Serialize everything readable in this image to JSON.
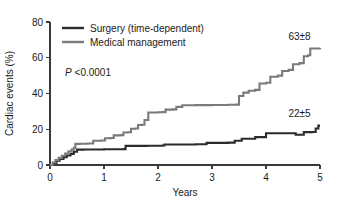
{
  "chart_data": {
    "type": "line",
    "subtype": "kaplan-meier-step",
    "title": "",
    "xlabel": "Years",
    "ylabel": "Cardiac events (%)",
    "xlim": [
      0,
      5
    ],
    "ylim": [
      0,
      80
    ],
    "xticks": [
      0,
      1,
      2,
      3,
      4,
      5
    ],
    "xtick_labels": [
      "0",
      "1",
      "2",
      "3",
      "4",
      "5"
    ],
    "yticks": [
      0,
      20,
      40,
      60,
      80
    ],
    "ytick_labels": [
      "0",
      "20",
      "40",
      "60",
      "80"
    ],
    "grid": false,
    "legend_position": "top-left",
    "annotations": [
      {
        "name": "p-value",
        "text_italic": "P",
        "text": " <0.0001",
        "x": 0.28,
        "y": 50
      },
      {
        "name": "medical-endpoint",
        "text": "63±8",
        "x": 4.62,
        "y": 70
      },
      {
        "name": "surgery-endpoint",
        "text": "22±5",
        "x": 4.62,
        "y": 27
      }
    ],
    "series": [
      {
        "name": "Surgery (time-dependent)",
        "legend_label": "Surgery (time-dependent)",
        "color": "#2b2b2b",
        "width": 2.1,
        "endpoint_label": "22±5",
        "points": [
          [
            0.0,
            0.0
          ],
          [
            0.06,
            1.2
          ],
          [
            0.12,
            2.4
          ],
          [
            0.18,
            3.4
          ],
          [
            0.25,
            4.4
          ],
          [
            0.31,
            5.3
          ],
          [
            0.38,
            6.2
          ],
          [
            0.44,
            7.4
          ],
          [
            0.5,
            8.6
          ],
          [
            0.56,
            8.6
          ],
          [
            0.62,
            8.7
          ],
          [
            0.75,
            8.7
          ],
          [
            1.0,
            8.8
          ],
          [
            1.25,
            8.8
          ],
          [
            1.36,
            8.9
          ],
          [
            1.4,
            10.7
          ],
          [
            1.6,
            10.7
          ],
          [
            1.8,
            10.8
          ],
          [
            2.0,
            10.8
          ],
          [
            2.08,
            10.9
          ],
          [
            2.12,
            11.5
          ],
          [
            2.4,
            11.5
          ],
          [
            2.7,
            11.6
          ],
          [
            2.85,
            11.6
          ],
          [
            2.9,
            12.4
          ],
          [
            3.1,
            12.4
          ],
          [
            3.3,
            12.5
          ],
          [
            3.38,
            12.5
          ],
          [
            3.42,
            13.6
          ],
          [
            3.5,
            13.6
          ],
          [
            3.55,
            14.7
          ],
          [
            3.7,
            14.7
          ],
          [
            3.8,
            15.6
          ],
          [
            3.95,
            15.6
          ],
          [
            4.0,
            17.8
          ],
          [
            4.3,
            17.8
          ],
          [
            4.55,
            16.9
          ],
          [
            4.7,
            18.4
          ],
          [
            4.85,
            18.5
          ],
          [
            4.92,
            20.4
          ],
          [
            4.97,
            22.0
          ],
          [
            5.0,
            22.0
          ]
        ]
      },
      {
        "name": "Medical management",
        "legend_label": "Medical management",
        "color": "#7a7a7a",
        "width": 2.1,
        "endpoint_label": "63±8",
        "points": [
          [
            0.0,
            0.0
          ],
          [
            0.05,
            1.4
          ],
          [
            0.1,
            2.8
          ],
          [
            0.16,
            4.0
          ],
          [
            0.22,
            5.2
          ],
          [
            0.28,
            6.4
          ],
          [
            0.34,
            7.6
          ],
          [
            0.4,
            8.6
          ],
          [
            0.44,
            9.6
          ],
          [
            0.47,
            11.8
          ],
          [
            0.55,
            11.9
          ],
          [
            0.7,
            12.0
          ],
          [
            0.8,
            13.6
          ],
          [
            0.95,
            13.7
          ],
          [
            1.02,
            15.0
          ],
          [
            1.12,
            15.1
          ],
          [
            1.18,
            16.6
          ],
          [
            1.3,
            16.7
          ],
          [
            1.36,
            18.2
          ],
          [
            1.45,
            18.3
          ],
          [
            1.5,
            20.3
          ],
          [
            1.58,
            20.4
          ],
          [
            1.63,
            22.4
          ],
          [
            1.7,
            22.5
          ],
          [
            1.75,
            25.2
          ],
          [
            1.82,
            29.4
          ],
          [
            2.0,
            29.5
          ],
          [
            2.08,
            29.6
          ],
          [
            2.14,
            31.0
          ],
          [
            2.28,
            31.1
          ],
          [
            2.34,
            32.5
          ],
          [
            2.45,
            33.4
          ],
          [
            2.7,
            33.5
          ],
          [
            3.0,
            33.6
          ],
          [
            3.3,
            33.7
          ],
          [
            3.45,
            33.8
          ],
          [
            3.5,
            38.6
          ],
          [
            3.58,
            40.5
          ],
          [
            3.68,
            41.5
          ],
          [
            3.8,
            42.0
          ],
          [
            3.88,
            45.6
          ],
          [
            4.0,
            46.0
          ],
          [
            4.08,
            49.4
          ],
          [
            4.22,
            50.0
          ],
          [
            4.3,
            52.6
          ],
          [
            4.42,
            53.2
          ],
          [
            4.5,
            56.4
          ],
          [
            4.62,
            57.0
          ],
          [
            4.7,
            60.8
          ],
          [
            4.78,
            61.4
          ],
          [
            4.82,
            65.2
          ],
          [
            5.0,
            65.4
          ]
        ]
      }
    ]
  },
  "legend": {
    "items": [
      {
        "label": "Surgery (time-dependent)",
        "color": "#2b2b2b"
      },
      {
        "label": "Medical management",
        "color": "#7a7a7a"
      }
    ]
  }
}
